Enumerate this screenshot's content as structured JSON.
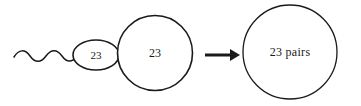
{
  "diagram": {
    "background_color": "#ffffff",
    "stroke_color": "#1a1a1a",
    "sperm": {
      "label": "23",
      "tail_name": "sperm-tail",
      "head_name": "sperm-head"
    },
    "egg": {
      "label": "23"
    },
    "arrow": {
      "direction": "right"
    },
    "zygote": {
      "label": "23 pairs"
    }
  }
}
